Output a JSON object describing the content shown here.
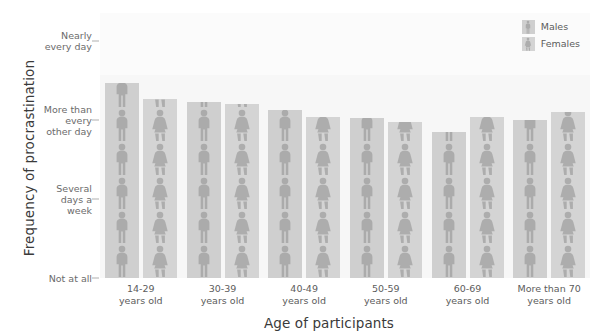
{
  "chart_data": {
    "type": "bar",
    "title": "",
    "xlabel": "Age of participants",
    "ylabel": "Frequency of procrastination",
    "categories": [
      "14-29\nyears old",
      "30-39\nyears old",
      "40-49\nyears old",
      "50-59\nyears old",
      "60-69\nyears old",
      "More than 70\nyears old"
    ],
    "y_tick_labels": [
      "Not at all",
      "Several days a week",
      "More than every other day",
      "Nearly every day"
    ],
    "y_tick_values": [
      0,
      1,
      2,
      3
    ],
    "ylim": [
      0,
      3.35
    ],
    "grid": false,
    "legend_position": "top-right",
    "series": [
      {
        "name": "Males",
        "color": "#cfcfcf",
        "values": [
          2.46,
          2.22,
          2.13,
          2.02,
          1.84,
          2.0
        ]
      },
      {
        "name": "Females",
        "color": "#d4d4d4",
        "values": [
          2.26,
          2.2,
          2.04,
          1.97,
          2.03,
          2.1
        ]
      }
    ]
  },
  "axes": {
    "y_title": "Frequency of procrastination",
    "x_title": "Age of participants",
    "y_ticks": [
      {
        "label": "Nearly\nevery day",
        "value": 3
      },
      {
        "label": "More than\nevery\nother day",
        "value": 2
      },
      {
        "label": "Several\ndays a\nweek",
        "value": 1
      },
      {
        "label": "Not at all",
        "value": 0
      }
    ],
    "x_ticks": [
      {
        "line1": "14-29",
        "line2": "years old"
      },
      {
        "line1": "30-39",
        "line2": "years old"
      },
      {
        "line1": "40-49",
        "line2": "years old"
      },
      {
        "line1": "50-59",
        "line2": "years old"
      },
      {
        "line1": "60-69",
        "line2": "years old"
      },
      {
        "line1": "More than 70",
        "line2": "years old"
      }
    ]
  },
  "legend": {
    "items": [
      {
        "label": "Males",
        "icon": "male-pictogram-icon"
      },
      {
        "label": "Females",
        "icon": "female-pictogram-icon"
      }
    ]
  },
  "colors": {
    "panel_background": "#f7f7f7",
    "male_bar": "#cfcfcf",
    "female_bar": "#d4d4d4",
    "text": "#5c5c5c",
    "title_text": "#3a3a3a"
  }
}
